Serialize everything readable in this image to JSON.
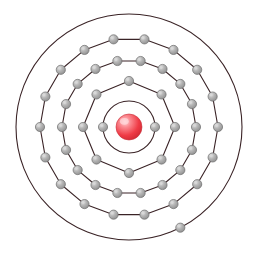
{
  "figure": {
    "type": "bohr-atom-model",
    "background_color": "#ffffff",
    "width": 260,
    "height": 254
  },
  "nucleus": {
    "label": "nucleus",
    "center_x": 129,
    "center_y": 127,
    "radius": 13,
    "color": "#ef3b46",
    "highlight_color": "#ffc9cc",
    "edge_color": "#c22832"
  },
  "orbit_style": {
    "stroke_color": "#3a2326",
    "stroke_width": 1.1,
    "fill": "none"
  },
  "electron_style": {
    "fill_color": "#a9a9a9",
    "highlight_color": "#d8d8d8",
    "edge_color": "#6e6e6e",
    "radius": 4.6
  },
  "shells": [
    {
      "index": 1,
      "name": "shell-1",
      "radius": 26,
      "electron_count": 2,
      "start_angle": 0
    },
    {
      "index": 2,
      "name": "shell-2",
      "radius": 46,
      "electron_count": 8,
      "start_angle": 0
    },
    {
      "index": 3,
      "name": "shell-3",
      "radius": 67,
      "electron_count": 18,
      "start_angle": 0
    },
    {
      "index": 4,
      "name": "shell-4",
      "radius": 89,
      "electron_count": 18,
      "start_angle": 0
    },
    {
      "index": 5,
      "name": "shell-5",
      "radius": 113,
      "electron_count": 1,
      "start_angle": 63
    }
  ],
  "chart_data": {
    "type": "scatter",
    "categories": [
      "Shell 1",
      "Shell 2",
      "Shell 3",
      "Shell 4",
      "Shell 5"
    ],
    "values": [
      2,
      8,
      18,
      18,
      1
    ],
    "xlabel": "Electron shell",
    "ylabel": "Number of electrons",
    "legend": []
  }
}
